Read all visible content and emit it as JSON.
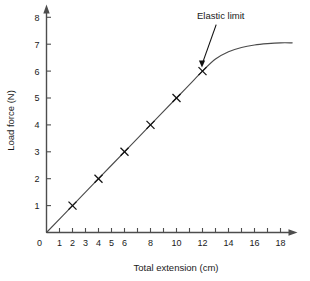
{
  "chart_data": {
    "type": "line",
    "title": "",
    "xlabel": "Total extension (cm)",
    "ylabel": "Load force (N)",
    "xlim": [
      0,
      19
    ],
    "ylim": [
      0,
      8.4
    ],
    "grid": false,
    "legend": "none",
    "x_ticks": [
      0,
      1,
      2,
      3,
      4,
      5,
      6,
      7,
      8,
      9,
      10,
      11,
      12,
      13,
      14,
      15,
      16,
      17,
      18
    ],
    "x_tick_labels": [
      "0",
      "1",
      "2",
      "3",
      "4",
      "5",
      "6",
      "",
      "8",
      "",
      "10",
      "",
      "12",
      "",
      "14",
      "",
      "16",
      "",
      "18"
    ],
    "y_ticks": [
      0,
      1,
      2,
      3,
      4,
      5,
      6,
      7,
      8
    ],
    "y_tick_labels": [
      "0",
      "1",
      "2",
      "3",
      "4",
      "5",
      "6",
      "7",
      "8"
    ],
    "origin_label": "0",
    "marker_symbol": "x",
    "marker_points": [
      {
        "x": 2,
        "y": 1
      },
      {
        "x": 4,
        "y": 2
      },
      {
        "x": 6,
        "y": 3
      },
      {
        "x": 8,
        "y": 4
      },
      {
        "x": 10,
        "y": 5
      },
      {
        "x": 12,
        "y": 6
      }
    ],
    "curve_points": [
      {
        "x": 0,
        "y": 0
      },
      {
        "x": 2,
        "y": 1
      },
      {
        "x": 4,
        "y": 2
      },
      {
        "x": 6,
        "y": 3
      },
      {
        "x": 8,
        "y": 4
      },
      {
        "x": 10,
        "y": 5
      },
      {
        "x": 11,
        "y": 5.5
      },
      {
        "x": 12,
        "y": 6
      },
      {
        "x": 13,
        "y": 6.45
      },
      {
        "x": 14,
        "y": 6.72
      },
      {
        "x": 15,
        "y": 6.88
      },
      {
        "x": 16,
        "y": 6.97
      },
      {
        "x": 17,
        "y": 7.02
      },
      {
        "x": 18,
        "y": 7.05
      },
      {
        "x": 18.9,
        "y": 7.05
      }
    ],
    "annotations": [
      {
        "text": "Elastic limit",
        "points_to_x": 12,
        "points_to_y": 6,
        "label_x": 13.4,
        "label_y": 7.95
      }
    ],
    "colors": {
      "curve": "#4a4a4a",
      "axis": "#4d4d4d",
      "marker": "#111111",
      "text": "#1a1a1a",
      "background": "#ffffff"
    }
  }
}
